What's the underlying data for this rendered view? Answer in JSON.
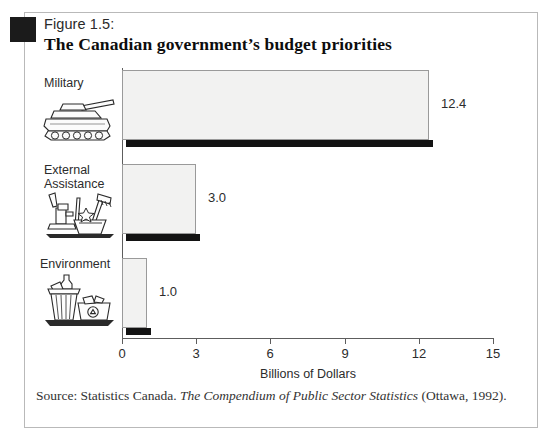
{
  "figure": {
    "bullet": "black-square-marker",
    "caption": "Figure 1.5:",
    "title": "The Canadian government’s budget priorities"
  },
  "chart_data": {
    "type": "bar",
    "orientation": "horizontal",
    "title": "The Canadian government’s budget priorities",
    "subtitle": "Figure 1.5:",
    "categories": [
      "Military",
      "External\nAssistance",
      "Environment"
    ],
    "values": [
      12.4,
      3.0,
      1.0
    ],
    "value_labels": [
      "12.4",
      "3.0",
      "1.0"
    ],
    "xlabel": "Billions of Dollars",
    "ylabel": "",
    "xlim": [
      0,
      15
    ],
    "xticks": [
      0,
      3,
      6,
      9,
      12,
      15
    ],
    "xtick_labels": [
      "0",
      "3",
      "6",
      "9",
      "12",
      "15"
    ],
    "grid": false,
    "legend": null,
    "bar_fill_color": "#f2f2f1",
    "bar_border_color": "#9a9a9a",
    "bar_shadow_color": "#131313",
    "axis_color": "#5d5d5d",
    "icons": [
      "tank-icon",
      "water-pump-icon",
      "recycling-bins-icon"
    ]
  },
  "axis": {
    "ticks": [
      {
        "value": 0,
        "label": "0"
      },
      {
        "value": 3,
        "label": "3"
      },
      {
        "value": 6,
        "label": "6"
      },
      {
        "value": 9,
        "label": "9"
      },
      {
        "value": 12,
        "label": "12"
      },
      {
        "value": 15,
        "label": "15"
      }
    ],
    "title": "Billions of Dollars"
  },
  "bars": [
    {
      "category": "Military",
      "label": "Military",
      "value": 12.4,
      "value_label": "12.4",
      "icon": "tank-icon"
    },
    {
      "category": "External Assistance",
      "label": "External\nAssistance",
      "value": 3.0,
      "value_label": "3.0",
      "icon": "water-pump-icon"
    },
    {
      "category": "Environment",
      "label": "Environment",
      "value": 1.0,
      "value_label": "1.0",
      "icon": "recycling-bins-icon"
    }
  ],
  "source": {
    "prefix": "Source: Statistics Canada. ",
    "italic": "The Compendium of Public Sector Statistics",
    "suffix": " (Ottawa, 1992)."
  }
}
